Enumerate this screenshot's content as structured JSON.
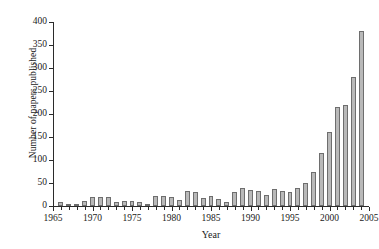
{
  "chart_data": {
    "type": "bar",
    "title": "",
    "xlabel": "Year",
    "ylabel": "Number of papers published",
    "xlim": [
      1965,
      2005
    ],
    "ylim": [
      0,
      400
    ],
    "yticks": [
      0,
      50,
      100,
      150,
      200,
      250,
      300,
      350,
      400
    ],
    "ytick_labels": [
      "0",
      "50",
      "100",
      "150",
      "200",
      "250",
      "300",
      "350",
      "400"
    ],
    "xticks": [
      1965,
      1970,
      1975,
      1980,
      1985,
      1990,
      1995,
      2000,
      2005
    ],
    "xtick_labels": [
      "1965",
      "1970",
      "1975",
      "1980",
      "1985",
      "1990",
      "1995",
      "2000",
      "2005"
    ],
    "grid": false,
    "legend": null,
    "bar_color": "#b9b9b9",
    "bar_edge_color": "#6e6e6e",
    "categories": [
      1966,
      1967,
      1968,
      1969,
      1970,
      1971,
      1972,
      1973,
      1974,
      1975,
      1976,
      1977,
      1978,
      1979,
      1980,
      1981,
      1982,
      1983,
      1984,
      1985,
      1986,
      1987,
      1988,
      1989,
      1990,
      1991,
      1992,
      1993,
      1994,
      1995,
      1996,
      1997,
      1998,
      1999,
      2000,
      2001,
      2002,
      2003,
      2004
    ],
    "values": [
      8,
      3,
      3,
      11,
      19,
      20,
      19,
      8,
      10,
      10,
      9,
      4,
      22,
      21,
      20,
      12,
      33,
      30,
      17,
      22,
      16,
      9,
      31,
      39,
      35,
      33,
      23,
      38,
      33,
      30,
      40,
      50,
      75,
      115,
      160,
      215,
      220,
      280,
      380
    ]
  }
}
